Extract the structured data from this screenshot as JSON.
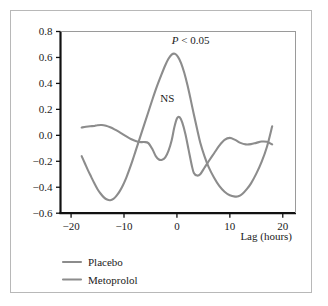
{
  "chart_data": {
    "type": "line",
    "title": "",
    "subtitle": "",
    "xlabel": "Lag  (hours)",
    "ylabel": "",
    "xlim": [
      -22,
      22.5
    ],
    "ylim": [
      -0.6,
      0.8
    ],
    "xticks": [
      -20,
      -10,
      0,
      10,
      20
    ],
    "xtick_labels": [
      "−20",
      "−10",
      "0",
      "10",
      "20"
    ],
    "yticks": [
      -0.6,
      -0.4,
      -0.2,
      0.0,
      0.2,
      0.4,
      0.6,
      0.8
    ],
    "ytick_labels": [
      "−0.6",
      "−0.4",
      "−0.2",
      "0.0",
      "0.2",
      "0.4",
      "0.6",
      "0.8"
    ],
    "grid": false,
    "legend_position": "below-left",
    "series": [
      {
        "name": "Placebo",
        "color": "#8c8c8c",
        "x": [
          -18.0,
          -17.2,
          -16.4,
          -15.6,
          -15.0,
          -14.2,
          -13.4,
          -12.6,
          -11.8,
          -11.0,
          -10.2,
          -9.4,
          -8.6,
          -7.8,
          -7.0,
          -6.2,
          -5.4,
          -4.6,
          -4.0,
          -3.4,
          -2.8,
          -2.2,
          -1.6,
          -1.0,
          -0.5,
          0.0,
          0.5,
          1.0,
          1.6,
          2.2,
          2.8,
          3.2,
          3.8,
          4.4,
          5.2,
          6.0,
          7.0,
          8.0,
          9.0,
          10.0,
          11.0,
          12.0,
          13.0,
          14.0,
          15.0,
          16.0,
          17.0,
          18.0
        ],
        "y": [
          0.06,
          0.066,
          0.07,
          0.072,
          0.078,
          0.08,
          0.074,
          0.062,
          0.046,
          0.028,
          0.008,
          -0.012,
          -0.03,
          -0.044,
          -0.052,
          -0.052,
          -0.06,
          -0.11,
          -0.16,
          -0.186,
          -0.188,
          -0.17,
          -0.12,
          -0.04,
          0.06,
          0.13,
          0.14,
          0.1,
          0.01,
          -0.11,
          -0.23,
          -0.29,
          -0.31,
          -0.3,
          -0.25,
          -0.2,
          -0.14,
          -0.08,
          -0.035,
          -0.02,
          -0.035,
          -0.058,
          -0.07,
          -0.068,
          -0.058,
          -0.048,
          -0.05,
          -0.07
        ]
      },
      {
        "name": "Metoprolol",
        "color": "#8c8c8c",
        "x": [
          -18.0,
          -17.4,
          -16.8,
          -16.2,
          -15.6,
          -15.0,
          -14.4,
          -13.8,
          -13.2,
          -12.6,
          -12.0,
          -11.4,
          -10.8,
          -10.2,
          -9.6,
          -9.0,
          -8.4,
          -7.8,
          -7.0,
          -6.2,
          -5.4,
          -4.6,
          -3.8,
          -3.0,
          -2.2,
          -1.6,
          -1.0,
          -0.4,
          0.2,
          0.8,
          1.4,
          2.0,
          2.6,
          3.2,
          3.8,
          4.4,
          5.2,
          6.0,
          7.0,
          8.0,
          9.0,
          10.0,
          11.0,
          11.6,
          12.4,
          13.2,
          14.0,
          15.0,
          16.0,
          17.0,
          18.0
        ],
        "y": [
          -0.16,
          -0.215,
          -0.27,
          -0.32,
          -0.37,
          -0.415,
          -0.45,
          -0.478,
          -0.495,
          -0.5,
          -0.49,
          -0.465,
          -0.43,
          -0.385,
          -0.33,
          -0.265,
          -0.195,
          -0.12,
          -0.02,
          0.08,
          0.18,
          0.28,
          0.375,
          0.46,
          0.54,
          0.59,
          0.622,
          0.628,
          0.605,
          0.555,
          0.48,
          0.385,
          0.275,
          0.16,
          0.05,
          -0.055,
          -0.16,
          -0.245,
          -0.325,
          -0.39,
          -0.435,
          -0.462,
          -0.472,
          -0.47,
          -0.45,
          -0.415,
          -0.37,
          -0.295,
          -0.205,
          -0.09,
          0.07
        ]
      }
    ],
    "annotations": [
      {
        "id": "p-value",
        "text_prefix": "P",
        "text_rest": " <  0.05",
        "x": 2.6,
        "y": 0.705
      },
      {
        "id": "ns",
        "text_prefix": "",
        "text_rest": "NS",
        "x": -1.8,
        "y": 0.255
      }
    ]
  },
  "legend": {
    "items": [
      {
        "label": "Placebo",
        "color": "#8c8c8c"
      },
      {
        "label": "Metoprolol",
        "color": "#8c8c8c"
      }
    ]
  }
}
